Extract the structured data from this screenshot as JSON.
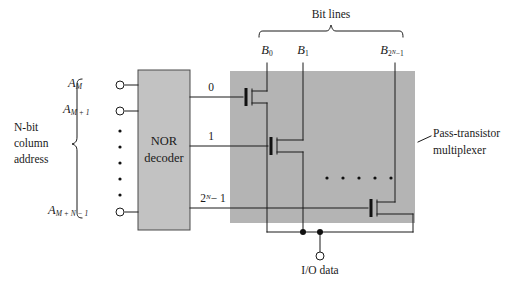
{
  "diagram": {
    "colors": {
      "block_fill": "#b8b8b8",
      "mux_fill": "#b0b0b0",
      "line": "#1a1a1a",
      "background": "#ffffff"
    }
  },
  "left": {
    "group_label_line1": "N-bit",
    "group_label_line2": "column",
    "group_label_line3": "address",
    "address_inputs": [
      {
        "base": "A",
        "sub": "M"
      },
      {
        "base": "A",
        "sub": "M + 1"
      },
      {
        "base": "A",
        "sub": "M + N − 1"
      }
    ],
    "vertical_ellipsis": "•"
  },
  "decoder": {
    "label_line1": "NOR",
    "label_line2": "decoder",
    "outputs": [
      {
        "text": "0"
      },
      {
        "text": "1"
      },
      {
        "text": "2",
        "sup": "N",
        "tail": "− 1"
      }
    ]
  },
  "bitlines": {
    "bracket_label": "Bit lines",
    "labels": [
      {
        "base": "B",
        "sub": "0"
      },
      {
        "base": "B",
        "sub": "1"
      },
      {
        "base": "B",
        "sub_pre": "2",
        "sub_sup": "N",
        "sub_post": "−1"
      }
    ]
  },
  "mux": {
    "label_line1": "Pass-transistor",
    "label_line2": "multiplexer",
    "ellipsis_dot": "•",
    "ellipsis_count": 5
  },
  "output": {
    "label": "I/O data"
  }
}
